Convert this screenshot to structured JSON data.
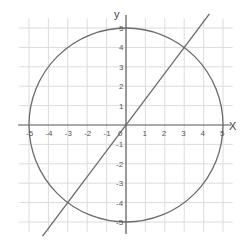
{
  "chart_data": {
    "type": "line",
    "title": "",
    "xlabel": "X",
    "ylabel": "y",
    "xlim": [
      -5.5,
      5.5
    ],
    "ylim": [
      -5.5,
      5.5
    ],
    "grid": true,
    "x_ticks": [
      "-5",
      "-4",
      "-3",
      "-2",
      "-1",
      "0",
      "1",
      "2",
      "3",
      "4",
      "5"
    ],
    "y_ticks": [
      "5",
      "4",
      "3",
      "2",
      "1",
      "-1",
      "-2",
      "-3",
      "-4",
      "-5"
    ],
    "series": [
      {
        "name": "circle",
        "shape": "circle",
        "center": [
          0,
          0
        ],
        "radius": 5,
        "equation": "x^2 + y^2 = 25"
      },
      {
        "name": "line",
        "shape": "line",
        "slope": 1.333,
        "equation": "y = 4x/3",
        "x_range": [
          -4.3,
          4.3
        ]
      }
    ],
    "intersections": [
      [
        3,
        4
      ],
      [
        -3,
        -4
      ]
    ],
    "colors": {
      "curve": "#6b6b6b",
      "grid": "#dcdcdc",
      "axis": "#555555"
    }
  }
}
